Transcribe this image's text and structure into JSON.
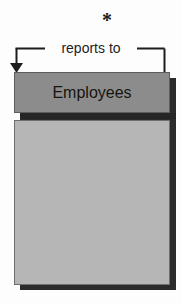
{
  "diagram": {
    "type": "entity-relationship-diagram",
    "background_color": "#fdfdfd",
    "relationship": {
      "label": "reports to",
      "cardinality_marker": "*",
      "cardinality_meaning": "many",
      "kind": "self-referencing",
      "line_color": "#1d1d1d",
      "arrow_direction": "down",
      "arrow_target": "Employees"
    },
    "entity": {
      "name": "Employees",
      "header_color": "#8c8c8c",
      "body_color": "#b6b6b6",
      "header_text_color": "#15150f",
      "border_color": "#5d5d5d",
      "shadow_color": "#2b2b2b",
      "attributes": []
    }
  }
}
